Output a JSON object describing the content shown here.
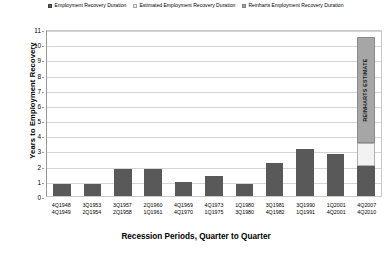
{
  "legend": {
    "items": [
      {
        "label": "Employment Recovery Duration",
        "swatch": "dark-swatch-icon"
      },
      {
        "label": "Estimated Employment Recovery Duration",
        "swatch": "light-swatch-icon"
      },
      {
        "label": "Reinharts Employment Recovery Duration",
        "swatch": "gray-swatch-icon"
      }
    ]
  },
  "annotations": {
    "reinhart_estimate": "REINHARTS ESTIMATE"
  },
  "colors": {
    "actual": "#595959",
    "estimated": "#f2f2f2",
    "reinhart": "#a6a6a6",
    "gridline": "#d4d4d4",
    "axis": "#9a9a9a"
  },
  "chart_data": {
    "type": "bar",
    "title": "",
    "xlabel": "Recession Periods, Quarter to Quarter",
    "ylabel": "Years to Employment Recovery",
    "ylim": [
      0,
      11
    ],
    "yticks": [
      11,
      10,
      9,
      8,
      7,
      6,
      5,
      4,
      3,
      2,
      1,
      0
    ],
    "grid": true,
    "legend_position": "top",
    "stacked": true,
    "categories": [
      "4Q1948\n4Q1949",
      "3Q1953\n2Q1954",
      "3Q1957\n2Q1958",
      "2Q1960\n1Q1961",
      "4Q1969\n4Q1970",
      "4Q1973\n1Q1975",
      "1Q1980\n3Q1980",
      "3Q1981\n4Q1982",
      "3Q1990\n1Q1991",
      "1Q2001\n4Q2001",
      "4Q2007\n4Q2010"
    ],
    "category_lines": [
      [
        "4Q1948",
        "4Q1949"
      ],
      [
        "3Q1953",
        "2Q1954"
      ],
      [
        "3Q1957",
        "2Q1958"
      ],
      [
        "2Q1960",
        "1Q1961"
      ],
      [
        "4Q1969",
        "4Q1970"
      ],
      [
        "4Q1973",
        "1Q1975"
      ],
      [
        "1Q1980",
        "3Q1980"
      ],
      [
        "3Q1981",
        "4Q1982"
      ],
      [
        "3Q1990",
        "1Q1991"
      ],
      [
        "1Q2001",
        "4Q2001"
      ],
      [
        "4Q2007",
        "4Q2010"
      ]
    ],
    "series": [
      {
        "name": "Employment Recovery Duration",
        "color": "#595959",
        "values": [
          0.8,
          0.8,
          1.8,
          1.8,
          0.9,
          1.3,
          0.8,
          2.2,
          3.1,
          2.8,
          2.0
        ]
      },
      {
        "name": "Estimated Employment Recovery Duration",
        "color": "#f2f2f2",
        "values": [
          0,
          0,
          0,
          0,
          0,
          0,
          0,
          0,
          0,
          0,
          1.5
        ]
      },
      {
        "name": "Reinharts Employment Recovery Duration",
        "color": "#a6a6a6",
        "values": [
          0,
          0,
          0,
          0,
          0,
          0,
          0,
          0,
          0,
          0,
          7.0
        ]
      }
    ]
  }
}
